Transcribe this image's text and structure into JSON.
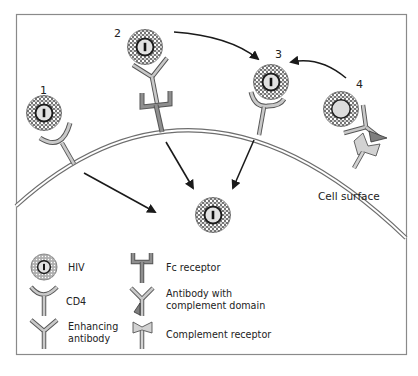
{
  "diagram": {
    "step_labels": [
      "1",
      "2",
      "3",
      "4"
    ],
    "cell_surface_label": "Cell surface",
    "colors": {
      "frame": "#8a8a8a",
      "membrane": "#6e6e6e",
      "receptor_light": "#c9c9c9",
      "fc_receptor": "#8f8f8f",
      "complement_domain": "#7e7e7e",
      "virus_core": "#e2e2e2",
      "arrow": "#1a1a1a"
    }
  },
  "legend": {
    "items": [
      {
        "id": "hiv",
        "label": "HIV"
      },
      {
        "id": "cd4",
        "label": "CD4"
      },
      {
        "id": "enhancing-antibody",
        "label_line1": "Enhancing",
        "label_line2": "antibody"
      },
      {
        "id": "fc-receptor",
        "label": "Fc receptor"
      },
      {
        "id": "antibody-complement",
        "label_line1": "Antibody with",
        "label_line2": "complement domain"
      },
      {
        "id": "complement-receptor",
        "label": "Complement receptor"
      }
    ]
  }
}
